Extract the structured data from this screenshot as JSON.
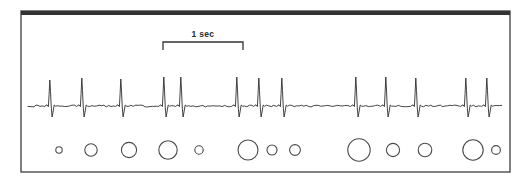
{
  "figure": {
    "kind": "electrophysiology-recording",
    "background_color": "#ffffff",
    "ink_color": "#333333",
    "frame": {
      "name": "panel-border",
      "x": 21,
      "y": 11,
      "width": 489,
      "height": 161,
      "stroke_color": "#4a4a4a",
      "stroke_width": 1.4,
      "top_border_color": "#333333",
      "top_border_width": 4
    },
    "scale_bar": {
      "label": "1 sec",
      "label_x": 203,
      "label_y": 37,
      "bracket_left_x": 163,
      "bracket_right_x": 243,
      "bracket_top_y": 42,
      "bracket_tick_bottom_y": 50,
      "stroke_color": "#333333",
      "stroke_width": 1.3
    },
    "trace": {
      "name": "ecg-trace",
      "baseline_y": 106,
      "peak_y": 78,
      "trough_y": 117,
      "stroke_color": "#2e2e2e",
      "stroke_width": 0.9,
      "start_x": 28,
      "end_x": 502,
      "spike_x_positions": [
        50,
        82,
        121,
        164,
        181,
        237,
        259,
        282,
        356,
        386,
        416,
        466,
        487
      ],
      "spike_amplitudes": [
        26,
        28,
        27,
        29,
        29,
        29,
        28,
        28,
        29,
        29,
        28,
        28,
        28
      ]
    },
    "markers": {
      "name": "stimulus-markers",
      "center_y": 150,
      "stroke_color": "#4a4a4a",
      "stroke_width": 1.1,
      "fill": "none",
      "circles": [
        {
          "cx": 59,
          "r": 3.2
        },
        {
          "cx": 91,
          "r": 6.2
        },
        {
          "cx": 129,
          "r": 7.6
        },
        {
          "cx": 168,
          "r": 9.2
        },
        {
          "cx": 199,
          "r": 4.2
        },
        {
          "cx": 248,
          "r": 10.0
        },
        {
          "cx": 272,
          "r": 5.0
        },
        {
          "cx": 295,
          "r": 5.4
        },
        {
          "cx": 359,
          "r": 11.2
        },
        {
          "cx": 393,
          "r": 6.6
        },
        {
          "cx": 425,
          "r": 6.8
        },
        {
          "cx": 473,
          "r": 10.2
        },
        {
          "cx": 496,
          "r": 4.4
        }
      ]
    }
  }
}
